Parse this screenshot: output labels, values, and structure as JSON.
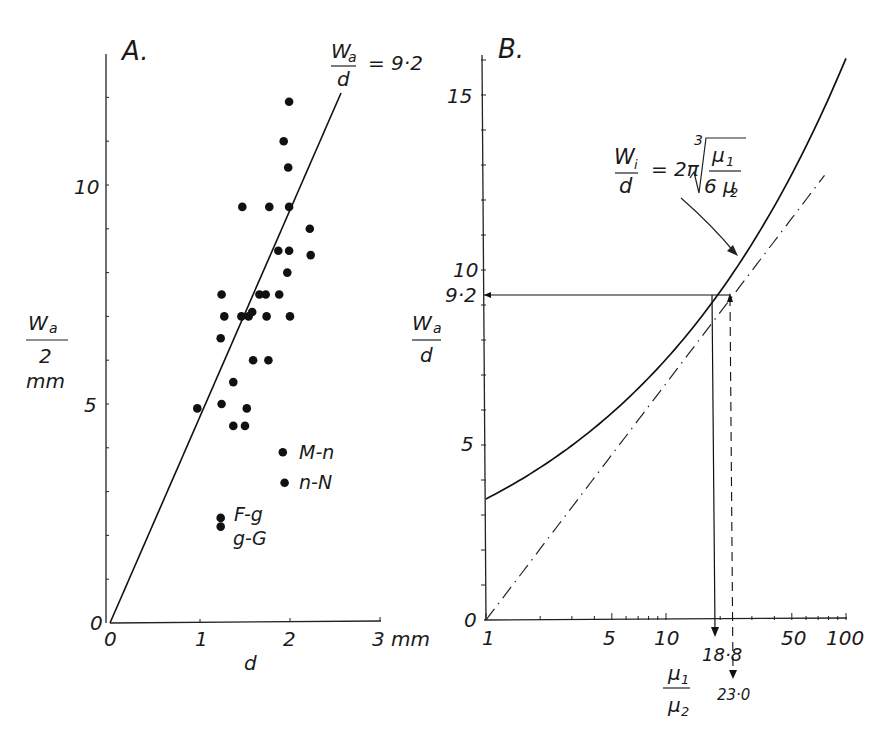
{
  "panel_a": {
    "title": "A.",
    "line_label_num": "W",
    "line_label_sub": "a",
    "line_label_den": "d",
    "line_label_eq": "= 9·2",
    "ylabel_num": "W",
    "ylabel_sub": "a",
    "ylabel_den": "2",
    "ylabel_unit": "mm",
    "xlabel": "d",
    "xunit": "3 mm",
    "xticks": [
      "0",
      "1",
      "2"
    ],
    "yticks": [
      "0",
      "5",
      "10"
    ],
    "annotations": [
      "M-n",
      "n-N",
      "F-g",
      "g-G"
    ]
  },
  "panel_b": {
    "title": "B.",
    "ylabel_num": "W",
    "ylabel_sub": "a",
    "ylabel_den": "d",
    "yticks": [
      "0",
      "5",
      "10",
      "15"
    ],
    "ymark": "9·2",
    "xticks": [
      "1",
      "5",
      "10",
      "50",
      "100"
    ],
    "xlabel_num": "μ",
    "xlabel_num_sub": "1",
    "xlabel_den": "μ",
    "xlabel_den_sub": "2",
    "mark_solid": "18·8",
    "mark_dashed": "23·0",
    "formula_num": "W",
    "formula_sub": "i",
    "formula_den": "d",
    "formula_eq": "= 2π",
    "formula_root_index": "3",
    "formula_frac_num": "μ",
    "formula_frac_num_sub": "1",
    "formula_frac_den": "6 μ",
    "formula_frac_den_sub": "2"
  },
  "chart_data": [
    {
      "type": "scatter",
      "title": "A.",
      "xlabel": "d (mm)",
      "ylabel": "Wa/2 (mm)",
      "xlim": [
        0,
        3
      ],
      "ylim": [
        0,
        12.5
      ],
      "grid": false,
      "fit_line": {
        "label": "Wa/d = 9.2",
        "slope": 4.6,
        "from": [
          0,
          0
        ],
        "to": [
          2.57,
          11.8
        ]
      },
      "points": [
        {
          "x": 1.99,
          "y": 11.9
        },
        {
          "x": 1.93,
          "y": 11.0
        },
        {
          "x": 1.98,
          "y": 10.4
        },
        {
          "x": 1.47,
          "y": 9.5
        },
        {
          "x": 1.77,
          "y": 9.5
        },
        {
          "x": 1.99,
          "y": 9.5
        },
        {
          "x": 2.22,
          "y": 9.0
        },
        {
          "x": 1.87,
          "y": 8.5
        },
        {
          "x": 1.99,
          "y": 8.5
        },
        {
          "x": 2.23,
          "y": 8.4
        },
        {
          "x": 1.97,
          "y": 8.0
        },
        {
          "x": 1.24,
          "y": 7.5
        },
        {
          "x": 1.66,
          "y": 7.5
        },
        {
          "x": 1.73,
          "y": 7.5
        },
        {
          "x": 1.88,
          "y": 7.5
        },
        {
          "x": 1.27,
          "y": 7.0
        },
        {
          "x": 1.46,
          "y": 7.0
        },
        {
          "x": 1.54,
          "y": 7.0
        },
        {
          "x": 1.58,
          "y": 7.1
        },
        {
          "x": 1.74,
          "y": 7.0
        },
        {
          "x": 2.0,
          "y": 7.0
        },
        {
          "x": 1.23,
          "y": 6.5
        },
        {
          "x": 1.59,
          "y": 6.0
        },
        {
          "x": 1.76,
          "y": 6.0
        },
        {
          "x": 1.37,
          "y": 5.5
        },
        {
          "x": 0.97,
          "y": 4.9
        },
        {
          "x": 1.24,
          "y": 5.0
        },
        {
          "x": 1.52,
          "y": 4.9
        },
        {
          "x": 1.37,
          "y": 4.5
        },
        {
          "x": 1.5,
          "y": 4.5
        },
        {
          "x": 1.92,
          "y": 3.9,
          "label": "M-n"
        },
        {
          "x": 1.94,
          "y": 3.2,
          "label": "n-N"
        },
        {
          "x": 1.23,
          "y": 2.4,
          "label": "F-g"
        },
        {
          "x": 1.23,
          "y": 2.2,
          "label": "g-G"
        }
      ]
    },
    {
      "type": "line",
      "title": "B.",
      "xlabel": "μ1/μ2",
      "ylabel": "Wa/d",
      "xscale": "log",
      "xlim": [
        1,
        100
      ],
      "ylim": [
        0,
        16
      ],
      "grid": false,
      "series": [
        {
          "name": "Wi/d = 2π·∛(μ1/(6μ2))",
          "style": "solid",
          "x": [
            1,
            2,
            5,
            10,
            18.8,
            30,
            50,
            100
          ],
          "y": [
            3.46,
            4.36,
            5.92,
            7.45,
            9.2,
            10.75,
            12.75,
            16.05
          ]
        },
        {
          "name": "asymptote",
          "style": "dash-dot",
          "x": [
            1,
            5,
            10,
            23,
            50,
            100
          ],
          "y": [
            0,
            4.7,
            6.76,
            9.2,
            11.5,
            13.5
          ]
        }
      ],
      "annotations": [
        {
          "text": "9·2",
          "y": 9.2,
          "type": "hline"
        },
        {
          "text": "18·8",
          "x": 18.8,
          "type": "vline-solid-arrow"
        },
        {
          "text": "23·0",
          "x": 23.0,
          "type": "vline-dashed-arrow"
        }
      ]
    }
  ]
}
